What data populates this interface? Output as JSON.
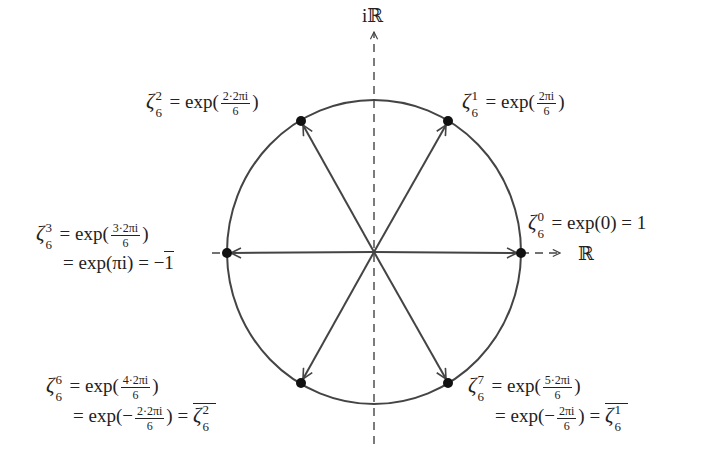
{
  "diagram": {
    "axes": {
      "real_label": "ℝ",
      "imag_label": "iℝ"
    },
    "colors": {
      "stroke": "#444444",
      "dot": "#111111",
      "text": "#222222"
    },
    "geometry": {
      "center": [
        374,
        252
      ],
      "rx": 147,
      "ry": 152
    },
    "points": [
      {
        "id": "zeta0",
        "angle_deg": 0,
        "xy": [
          521,
          253
        ]
      },
      {
        "id": "zeta1",
        "angle_deg": 60,
        "xy": [
          448,
          121
        ]
      },
      {
        "id": "zeta2",
        "angle_deg": 120,
        "xy": [
          301,
          121
        ]
      },
      {
        "id": "zeta3",
        "angle_deg": 180,
        "xy": [
          227,
          253
        ]
      },
      {
        "id": "zeta6",
        "angle_deg": 240,
        "xy": [
          301,
          383
        ]
      },
      {
        "id": "zeta7",
        "angle_deg": 300,
        "xy": [
          448,
          383
        ]
      }
    ],
    "labels": {
      "zeta0": {
        "sym": "ζ",
        "sup": "0",
        "sub": "6",
        "line1": "= exp(0) = 1"
      },
      "zeta1": {
        "sym": "ζ",
        "sup": "1",
        "sub": "6",
        "eq": "= exp(",
        "frac_num": "2πi",
        "frac_den": "6",
        "close": ")"
      },
      "zeta2": {
        "sym": "ζ",
        "sup": "2",
        "sub": "6",
        "eq": "= exp(",
        "frac_num": "2·2πi",
        "frac_den": "6",
        "close": ")"
      },
      "zeta3": {
        "sym": "ζ",
        "sup": "3",
        "sub": "6",
        "eq": "= exp(",
        "frac_num": "3·2πi",
        "frac_den": "6",
        "close": ")",
        "line2": "= exp(πi) = −",
        "line2_bar": "1"
      },
      "zeta6": {
        "sym": "ζ",
        "sup": "6",
        "sub": "6",
        "eq": "= exp(",
        "frac_num": "4·2πi",
        "frac_den": "6",
        "close": ")",
        "line2_eq": "= exp(−",
        "line2_frac_num": "2·2πi",
        "line2_frac_den": "6",
        "line2_close": ") =",
        "conj_sym": "ζ",
        "conj_sup": "2",
        "conj_sub": "6"
      },
      "zeta7": {
        "sym": "ζ",
        "sup": "7",
        "sub": "6",
        "eq": "= exp(",
        "frac_num": "5·2πi",
        "frac_den": "6",
        "close": ")",
        "line2_eq": "= exp(−",
        "line2_frac_num": "2πi",
        "line2_frac_den": "6",
        "line2_close": ") =",
        "conj_sym": "ζ",
        "conj_sup": "1",
        "conj_sub": "6"
      }
    }
  }
}
